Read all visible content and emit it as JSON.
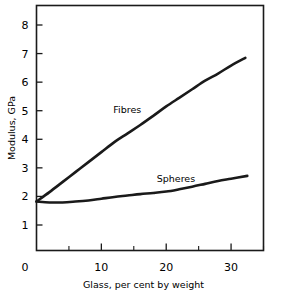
{
  "chart_data": {
    "type": "line",
    "title": "",
    "xlabel": "Glass, per cent by weight",
    "ylabel": "Modulus, GPa",
    "xlim": [
      0,
      35
    ],
    "ylim": [
      0,
      8.6
    ],
    "grid": false,
    "legend": "inline-annotations",
    "x_ticks_major": [
      0,
      10,
      20,
      30
    ],
    "x_ticks_minor": [
      5,
      15,
      25,
      35
    ],
    "x_tick_labels": [
      "0",
      "10",
      "20",
      "30"
    ],
    "y_ticks_major": [
      1,
      2,
      3,
      4,
      5,
      6,
      7,
      8
    ],
    "y_tick_labels": [
      "1",
      "2",
      "3",
      "4",
      "5",
      "6",
      "7",
      "8"
    ],
    "y_origin_label": "0",
    "line_color": "#1a1a1a",
    "axis_color": "#1a1a1a",
    "background_color": "#ffffff",
    "series": [
      {
        "name": "Fibres",
        "label": "Fibres",
        "label_x": 14.0,
        "label_y": 5.05,
        "x": [
          0.0,
          2.0,
          4.0,
          6.0,
          8.0,
          10.0,
          12.0,
          14.0,
          16.0,
          18.0,
          20.0,
          22.0,
          24.0,
          26.0,
          28.0,
          30.0,
          32.2
        ],
        "values": [
          1.82,
          2.15,
          2.5,
          2.85,
          3.2,
          3.55,
          3.9,
          4.2,
          4.5,
          4.82,
          5.15,
          5.45,
          5.75,
          6.05,
          6.3,
          6.58,
          6.85
        ]
      },
      {
        "name": "Spheres",
        "label": "Spheres",
        "label_x": 21.5,
        "label_y": 2.62,
        "x": [
          0.0,
          2.0,
          4.0,
          6.0,
          8.0,
          10.0,
          12.0,
          14.0,
          16.0,
          18.0,
          20.0,
          22.0,
          24.0,
          26.0,
          28.0,
          30.0,
          32.5
        ],
        "values": [
          1.82,
          1.79,
          1.79,
          1.82,
          1.86,
          1.92,
          1.98,
          2.03,
          2.08,
          2.12,
          2.17,
          2.25,
          2.34,
          2.44,
          2.54,
          2.62,
          2.72
        ]
      }
    ]
  }
}
